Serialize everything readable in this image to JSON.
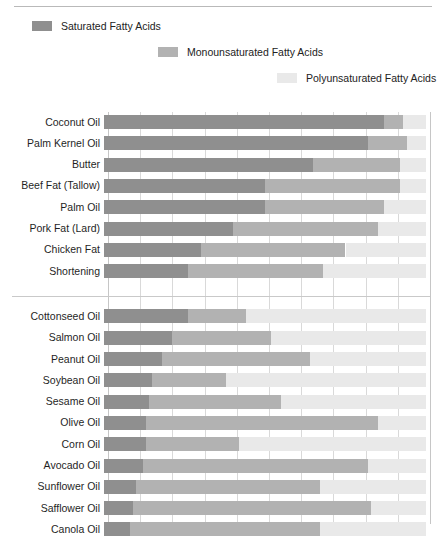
{
  "legend": {
    "items": [
      {
        "label": "Saturated Fatty Acids",
        "color": "#8f8f8f"
      },
      {
        "label": "Monounsaturated Fatty Acids",
        "color": "#b2b2b2"
      },
      {
        "label": "Polyunsaturated Fatty Acids",
        "color": "#e9e9e9"
      }
    ]
  },
  "chart_data": {
    "type": "bar",
    "orientation": "horizontal",
    "stacked": true,
    "normalized_percent": true,
    "title": "",
    "xlabel": "",
    "ylabel": "",
    "xlim": [
      0,
      100
    ],
    "xticks": [
      0,
      10,
      20,
      30,
      40,
      50,
      60,
      70,
      80,
      90,
      100
    ],
    "grid": true,
    "legend_position": "top",
    "series": [
      {
        "name": "Saturated Fatty Acids",
        "color": "#8f8f8f",
        "values": [
          87,
          82,
          65,
          50,
          50,
          40,
          30,
          26,
          26,
          21,
          18,
          15,
          14,
          13,
          13,
          12,
          10,
          9,
          8
        ]
      },
      {
        "name": "Monounsaturated Fatty Acids",
        "color": "#b2b2b2",
        "values": [
          6,
          12,
          27,
          42,
          37,
          45,
          45,
          42,
          18,
          31,
          46,
          23,
          41,
          72,
          29,
          70,
          57,
          74,
          59
        ]
      },
      {
        "name": "Polyunsaturated Fatty Acids",
        "color": "#e9e9e9",
        "values": [
          7,
          6,
          8,
          8,
          13,
          15,
          25,
          32,
          56,
          48,
          36,
          62,
          45,
          15,
          58,
          18,
          33,
          17,
          33
        ]
      }
    ],
    "categories": [
      "Coconut Oil",
      "Palm Kernel Oil",
      "Butter",
      "Beef Fat (Tallow)",
      "Palm Oil",
      "Pork Fat (Lard)",
      "Chicken Fat",
      "Shortening",
      "Cottonseed Oil",
      "Salmon Oil",
      "Peanut Oil",
      "Soybean Oil",
      "Sesame Oil",
      "Olive Oil",
      "Corn Oil",
      "Avocado Oil",
      "Sunflower Oil",
      "Safflower Oil",
      "Canola Oil"
    ],
    "groups": [
      {
        "start": 0,
        "count": 8
      },
      {
        "start": 8,
        "count": 11
      }
    ]
  }
}
